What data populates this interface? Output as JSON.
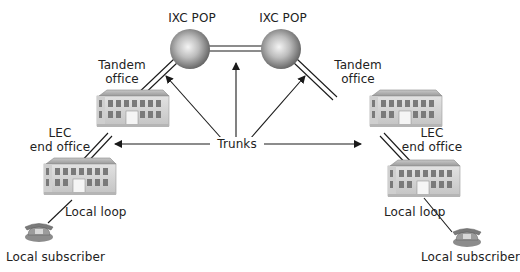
{
  "diagram": {
    "type": "telephone-network-hierarchy",
    "labels": {
      "ixc_pop_left": "IXC POP",
      "ixc_pop_right": "IXC POP",
      "tandem_left_line1": "Tandem",
      "tandem_left_line2": "office",
      "tandem_right_line1": "Tandem",
      "tandem_right_line2": "office",
      "lec_left_line1": "LEC",
      "lec_left_line2": "end office",
      "lec_right_line1": "LEC",
      "lec_right_line2": "end office",
      "trunks": "Trunks",
      "local_loop_left": "Local loop",
      "local_loop_right": "Local loop",
      "subscriber_left": "Local subscriber",
      "subscriber_right": "Local subscriber"
    },
    "nodes": [
      {
        "id": "ixc-pop-left",
        "kind": "sphere"
      },
      {
        "id": "ixc-pop-right",
        "kind": "sphere"
      },
      {
        "id": "tandem-office-left",
        "kind": "building"
      },
      {
        "id": "tandem-office-right",
        "kind": "building"
      },
      {
        "id": "lec-end-office-left",
        "kind": "building"
      },
      {
        "id": "lec-end-office-right",
        "kind": "building"
      },
      {
        "id": "local-subscriber-left",
        "kind": "telephone"
      },
      {
        "id": "local-subscriber-right",
        "kind": "telephone"
      }
    ],
    "links": [
      {
        "from": "ixc-pop-left",
        "to": "ixc-pop-right",
        "style": "double",
        "label": "Trunks"
      },
      {
        "from": "tandem-office-left",
        "to": "ixc-pop-left",
        "style": "double",
        "label": "Trunks"
      },
      {
        "from": "tandem-office-right",
        "to": "ixc-pop-right",
        "style": "double",
        "label": "Trunks"
      },
      {
        "from": "lec-end-office-left",
        "to": "tandem-office-left",
        "style": "double",
        "label": "Trunks"
      },
      {
        "from": "lec-end-office-right",
        "to": "tandem-office-right",
        "style": "double",
        "label": "Trunks"
      },
      {
        "from": "local-subscriber-left",
        "to": "lec-end-office-left",
        "style": "single",
        "label": "Local loop"
      },
      {
        "from": "local-subscriber-right",
        "to": "lec-end-office-right",
        "style": "single",
        "label": "Local loop"
      }
    ],
    "colors": {
      "line": "#1a1a1a",
      "sphere_highlight": "#f2f2f2",
      "sphere_shadow": "#555555",
      "building_wall": "#d9d9d9",
      "building_roof": "#a8a8a8",
      "window": "#7a7a7a",
      "text": "#222222"
    }
  }
}
